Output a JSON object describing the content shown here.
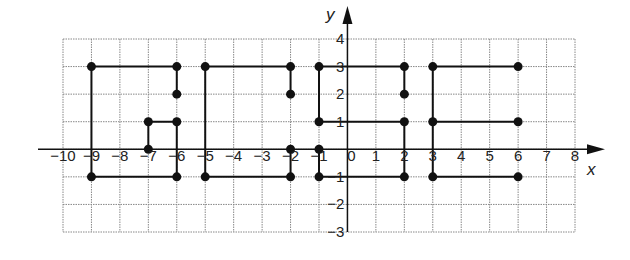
{
  "figure": {
    "type": "coordinate-grid-diagram",
    "x_axis_label": "x",
    "y_axis_label": "y",
    "x_range": [
      -10,
      8
    ],
    "y_range": [
      -3,
      4
    ],
    "x_ticks": [
      "−10",
      "−9",
      "−8",
      "−7",
      "−6",
      "−5",
      "−4",
      "−3",
      "−2",
      "−1",
      "0",
      "1",
      "2",
      "3",
      "4",
      "5",
      "6",
      "7",
      "8"
    ],
    "y_ticks": [
      "4",
      "3",
      "2",
      "1",
      "−1",
      "−2",
      "−3"
    ],
    "colors": {
      "grid": "#888888",
      "line": "#111111",
      "point": "#111111",
      "axis": "#111111"
    }
  },
  "chart_data": {
    "type": "line",
    "title": "",
    "xlabel": "x",
    "ylabel": "y",
    "xlim": [
      -10,
      8
    ],
    "ylim": [
      -3,
      4
    ],
    "grid": true,
    "series": [
      {
        "name": "letter-G-1",
        "points": [
          [
            -6,
            2
          ],
          [
            -6,
            3
          ],
          [
            -9,
            3
          ],
          [
            -9,
            -1
          ],
          [
            -6,
            -1
          ],
          [
            -6,
            1
          ],
          [
            -7,
            1
          ],
          [
            -7,
            0
          ]
        ]
      },
      {
        "name": "letter-G-2",
        "points": [
          [
            -2,
            2
          ],
          [
            -2,
            3
          ],
          [
            -5,
            3
          ],
          [
            -5,
            -1
          ],
          [
            -2,
            -1
          ],
          [
            -2,
            0
          ]
        ]
      },
      {
        "name": "letter-G-3",
        "points": [
          [
            2,
            2
          ],
          [
            2,
            3
          ],
          [
            -1,
            3
          ],
          [
            -1,
            1
          ],
          [
            2,
            1
          ],
          [
            2,
            -1
          ],
          [
            -1,
            -1
          ],
          [
            -1,
            0
          ]
        ]
      },
      {
        "name": "letter-E",
        "points": [
          [
            6,
            3
          ],
          [
            3,
            3
          ],
          [
            3,
            -1
          ],
          [
            6,
            -1
          ]
        ]
      },
      {
        "name": "letter-E-middle",
        "points": [
          [
            3,
            1
          ],
          [
            6,
            1
          ]
        ]
      }
    ],
    "marked_points": [
      [
        -9,
        3
      ],
      [
        -6,
        3
      ],
      [
        -6,
        2
      ],
      [
        -7,
        1
      ],
      [
        -6,
        1
      ],
      [
        -7,
        0
      ],
      [
        -9,
        -1
      ],
      [
        -6,
        -1
      ],
      [
        -5,
        3
      ],
      [
        -2,
        3
      ],
      [
        -2,
        2
      ],
      [
        -2,
        0
      ],
      [
        -5,
        -1
      ],
      [
        -2,
        -1
      ],
      [
        -1,
        3
      ],
      [
        2,
        3
      ],
      [
        2,
        2
      ],
      [
        -1,
        1
      ],
      [
        2,
        1
      ],
      [
        -1,
        0
      ],
      [
        -1,
        -1
      ],
      [
        2,
        -1
      ],
      [
        3,
        3
      ],
      [
        6,
        3
      ],
      [
        3,
        1
      ],
      [
        6,
        1
      ],
      [
        3,
        -1
      ],
      [
        6,
        -1
      ]
    ]
  }
}
